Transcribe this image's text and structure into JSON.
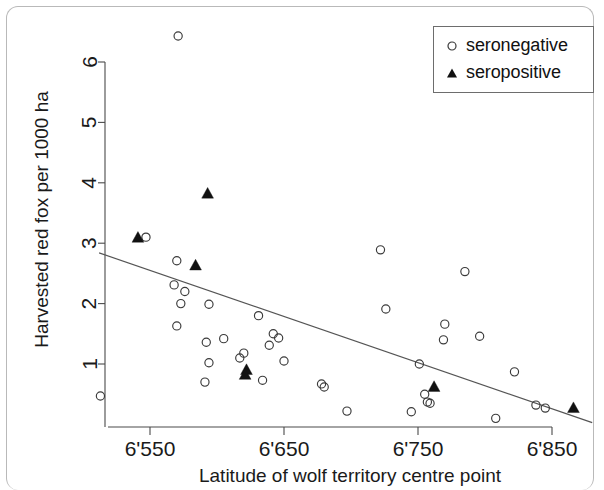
{
  "figure": {
    "background": "#ffffff",
    "frame_color": "#b9b9b9"
  },
  "legend": {
    "position": "top-right",
    "entries": [
      {
        "marker": "open-circle",
        "label": "seronegative"
      },
      {
        "marker": "filled-triangle",
        "label": "seropositive"
      }
    ]
  },
  "chart_data": {
    "type": "scatter",
    "title": "",
    "subtitle": "",
    "xlabel": "Latitude of wolf territory centre point",
    "ylabel": "Harvested red fox per 1000 ha",
    "xlim": [
      6510,
      6880
    ],
    "ylim": [
      0,
      6.35
    ],
    "xticks": [
      6550,
      6650,
      6750,
      6850
    ],
    "xticklabels": [
      "6'550",
      "6'650",
      "6'750",
      "6'850"
    ],
    "yticks": [
      1,
      2,
      3,
      4,
      5,
      6
    ],
    "yticklabels": [
      "1",
      "2",
      "3",
      "4",
      "5",
      "6"
    ],
    "grid": false,
    "legend_position": "top right",
    "marker_colors": {
      "seronegative": "#3a3a3a",
      "seropositive": "#111111",
      "trend": "#555555"
    },
    "series": [
      {
        "name": "seronegative",
        "marker": "open-circle",
        "points": [
          [
            6571,
            6.43
          ],
          [
            6547,
            3.1
          ],
          [
            6722,
            2.89
          ],
          [
            6570,
            2.71
          ],
          [
            6785,
            2.53
          ],
          [
            6568,
            2.31
          ],
          [
            6576,
            2.2
          ],
          [
            6573,
            2.0
          ],
          [
            6594,
            1.99
          ],
          [
            6726,
            1.91
          ],
          [
            6631,
            1.8
          ],
          [
            6770,
            1.66
          ],
          [
            6570,
            1.63
          ],
          [
            6642,
            1.5
          ],
          [
            6796,
            1.46
          ],
          [
            6646,
            1.43
          ],
          [
            6605,
            1.42
          ],
          [
            6769,
            1.4
          ],
          [
            6639,
            1.31
          ],
          [
            6592,
            1.36
          ],
          [
            6620,
            1.18
          ],
          [
            6617,
            1.1
          ],
          [
            6594,
            1.02
          ],
          [
            6650,
            1.05
          ],
          [
            6751,
            1.0
          ],
          [
            6822,
            0.87
          ],
          [
            6591,
            0.7
          ],
          [
            6634,
            0.73
          ],
          [
            6678,
            0.67
          ],
          [
            6680,
            0.62
          ],
          [
            6755,
            0.5
          ],
          [
            6757,
            0.37
          ],
          [
            6759,
            0.35
          ],
          [
            6838,
            0.32
          ],
          [
            6845,
            0.27
          ],
          [
            6513,
            0.47
          ],
          [
            6697,
            0.22
          ],
          [
            6745,
            0.21
          ],
          [
            6808,
            0.1
          ]
        ]
      },
      {
        "name": "seropositive",
        "marker": "filled-triangle",
        "points": [
          [
            6541,
            3.09
          ],
          [
            6593,
            3.82
          ],
          [
            6584,
            2.63
          ],
          [
            6622,
            0.9
          ],
          [
            6621,
            0.82
          ],
          [
            6762,
            0.62
          ],
          [
            6866,
            0.27
          ]
        ]
      }
    ],
    "trend_line": {
      "label": "regression line",
      "x": [
        6512,
        6880
      ],
      "y": [
        2.84,
        0.03
      ]
    }
  }
}
